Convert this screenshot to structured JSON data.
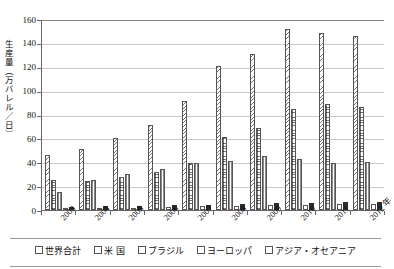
{
  "chart_data": {
    "type": "bar",
    "title": "",
    "xlabel": "年",
    "ylabel": "生産量（万バレル／日）",
    "ylim": [
      0,
      160
    ],
    "ytick_step": 20,
    "yticks": [
      "0",
      "20",
      "40",
      "60",
      "80",
      "100",
      "120",
      "140",
      "160"
    ],
    "grid": true,
    "legend_position": "bottom",
    "categories": [
      "2003",
      "2004",
      "2005",
      "2006",
      "2007",
      "2008",
      "2009",
      "2010",
      "2011",
      "2012 年"
    ],
    "series": [
      {
        "name": "世界合計",
        "pattern": "diagonal-hatch",
        "values": [
          46,
          51,
          60,
          71,
          91,
          121,
          131,
          152,
          148,
          146
        ]
      },
      {
        "name": "米 国",
        "pattern": "dots",
        "values": [
          25,
          24,
          28,
          32,
          39,
          61,
          69,
          85,
          89,
          86
        ]
      },
      {
        "name": "ブラジル",
        "pattern": "vertical-lines",
        "values": [
          15,
          25,
          30,
          34,
          39,
          41,
          45,
          43,
          39,
          40
        ]
      },
      {
        "name": "ヨーロッパ",
        "pattern": "white",
        "values": [
          1,
          1.5,
          2,
          2.5,
          3,
          3.5,
          4,
          4.5,
          5,
          5
        ]
      },
      {
        "name": "アジア・オセアニア",
        "pattern": "solid-black",
        "values": [
          2.5,
          3,
          3.5,
          4,
          4.5,
          5,
          5.5,
          6,
          6.5,
          7
        ]
      }
    ]
  }
}
